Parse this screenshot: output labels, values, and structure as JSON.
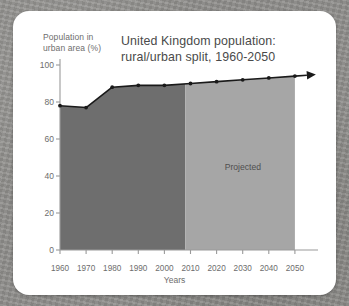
{
  "figure": {
    "title": "United Kingdom population:\nrural/urban split, 1960-2050",
    "title_line1": "United Kingdom population:",
    "title_line2": "rural/urban split, 1960-2050",
    "y_axis_label_line1": "Population in",
    "y_axis_label_line2": "urban area (%)",
    "x_axis_label": "Years",
    "annotation": "Projected",
    "colors": {
      "card_background": "#ffffff",
      "page_background": "#908f8c",
      "historical_fill": "#6e6e6e",
      "projected_fill": "#a6a6a6",
      "line": "#1a1a1a",
      "axis": "#9a9a9a",
      "text": "#6d6d6d",
      "title_text": "#4a4a4a"
    }
  },
  "chart_data": {
    "type": "area",
    "title": "United Kingdom population: rural/urban split, 1960-2050",
    "xlabel": "Years",
    "ylabel": "Population in urban area (%)",
    "xlim": [
      1960,
      2050
    ],
    "ylim": [
      0,
      100
    ],
    "grid": false,
    "legend": false,
    "x": [
      1960,
      1970,
      1980,
      1990,
      2000,
      2010,
      2020,
      2030,
      2040,
      2050
    ],
    "xticks": [
      "1960",
      "1970",
      "1980",
      "1990",
      "2000",
      "2010",
      "2020",
      "2030",
      "2040",
      "2050"
    ],
    "yticks": [
      "0",
      "20",
      "40",
      "60",
      "80",
      "100"
    ],
    "ytick_values": [
      0,
      20,
      40,
      60,
      80,
      100
    ],
    "series": [
      {
        "name": "Population in urban area (%)",
        "values": [
          78,
          77,
          88,
          89,
          89,
          90,
          91,
          92,
          93,
          94
        ],
        "marker": "dot",
        "line_color": "#1a1a1a"
      }
    ],
    "regions": [
      {
        "name": "historical",
        "x_start": 1960,
        "x_end": 2008,
        "fill": "#6e6e6e",
        "label": ""
      },
      {
        "name": "projected",
        "x_start": 2008,
        "x_end": 2050,
        "fill": "#a6a6a6",
        "label": "Projected"
      }
    ],
    "annotations": [
      {
        "text": "Projected",
        "x": 2030,
        "y": 45
      }
    ],
    "arrow_beyond_axis": true
  }
}
